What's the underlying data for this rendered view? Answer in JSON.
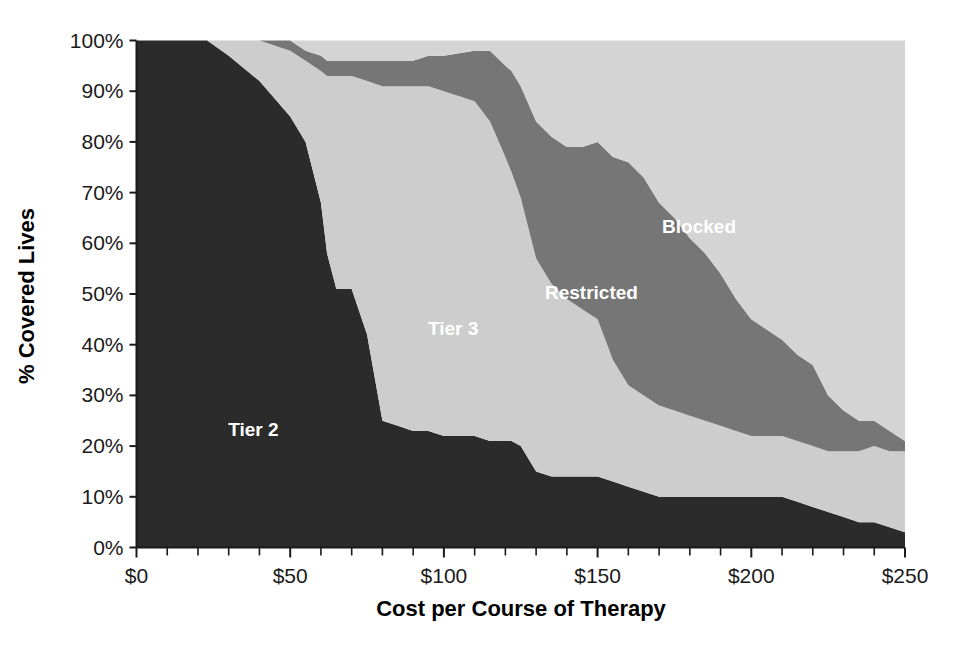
{
  "chart_data": {
    "type": "area",
    "title": "",
    "subtitle": "",
    "xlabel": "Cost per Course of Therapy",
    "ylabel": "% Covered Lives",
    "stacked": true,
    "grid": false,
    "legend_position": "inline-annotations",
    "xlim": [
      0,
      250
    ],
    "ylim": [
      0,
      100
    ],
    "x_tick_labels": [
      "$0",
      "$50",
      "$100",
      "$150",
      "$200",
      "$250"
    ],
    "x_tick_values": [
      0,
      50,
      100,
      150,
      200,
      250
    ],
    "x_minor_tick_interval": 10,
    "y_tick_labels": [
      "0%",
      "10%",
      "20%",
      "30%",
      "40%",
      "50%",
      "60%",
      "70%",
      "80%",
      "90%",
      "100%"
    ],
    "y_tick_values": [
      0,
      10,
      20,
      30,
      40,
      50,
      60,
      70,
      80,
      90,
      100
    ],
    "x": [
      0,
      10,
      20,
      23,
      30,
      40,
      50,
      55,
      60,
      62,
      65,
      70,
      75,
      80,
      85,
      90,
      95,
      100,
      110,
      115,
      120,
      122,
      125,
      130,
      135,
      140,
      145,
      150,
      155,
      160,
      165,
      170,
      175,
      180,
      185,
      190,
      195,
      200,
      205,
      210,
      215,
      220,
      225,
      230,
      235,
      240,
      245,
      250
    ],
    "series": [
      {
        "name": "Tier 2",
        "color": "#2b2b2b",
        "label_color": "#ffffff",
        "annotation": "Tier 2",
        "annotation_x": 38,
        "annotation_y": 22,
        "values": [
          100,
          100,
          100,
          100,
          97,
          92,
          85,
          80,
          68,
          58,
          51,
          51,
          42,
          25,
          24,
          23,
          23,
          22,
          22,
          21,
          21,
          21,
          20,
          15,
          14,
          14,
          14,
          14,
          13,
          12,
          11,
          10,
          10,
          10,
          10,
          10,
          10,
          10,
          10,
          10,
          9,
          8,
          7,
          6,
          5,
          5,
          4,
          3
        ]
      },
      {
        "name": "Tier 3",
        "color": "#cdcdcd",
        "label_color": "#ffffff",
        "annotation": "Tier 3",
        "annotation_x": 103,
        "annotation_y": 42,
        "values": [
          0,
          0,
          0,
          0,
          3,
          8,
          13,
          16,
          26,
          35,
          42,
          42,
          50,
          66,
          67,
          68,
          68,
          68,
          66,
          63,
          56,
          53,
          49,
          42,
          38,
          35,
          33,
          31,
          24,
          20,
          19,
          18,
          17,
          16,
          15,
          14,
          13,
          12,
          12,
          12,
          12,
          12,
          12,
          13,
          14,
          15,
          15,
          16
        ]
      },
      {
        "name": "Restricted",
        "color": "#767676",
        "label_color": "#ffffff",
        "annotation": "Restricted",
        "annotation_x": 148,
        "annotation_y": 49,
        "values": [
          0,
          0,
          0,
          0,
          0,
          0,
          2,
          2,
          3,
          3,
          3,
          3,
          4,
          5,
          5,
          5,
          6,
          7,
          10,
          14,
          18,
          20,
          22,
          27,
          29,
          30,
          32,
          35,
          40,
          44,
          43,
          40,
          38,
          35,
          33,
          30,
          26,
          23,
          21,
          19,
          17,
          16,
          11,
          8,
          6,
          5,
          4,
          2
        ]
      },
      {
        "name": "Blocked",
        "color": "#d4d4d4",
        "label_color": "#ffffff",
        "annotation": "Blocked",
        "annotation_x": 183,
        "annotation_y": 62,
        "values": [
          0,
          0,
          0,
          0,
          0,
          0,
          0,
          2,
          3,
          4,
          4,
          4,
          4,
          4,
          4,
          4,
          3,
          3,
          2,
          2,
          5,
          6,
          9,
          16,
          19,
          21,
          21,
          20,
          23,
          24,
          27,
          32,
          35,
          39,
          42,
          46,
          51,
          55,
          57,
          59,
          62,
          64,
          70,
          73,
          75,
          75,
          77,
          79
        ]
      }
    ]
  }
}
